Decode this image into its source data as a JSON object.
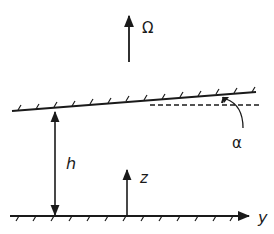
{
  "diagram": {
    "type": "rotating-channel-geometry",
    "labels": {
      "omega": "Ω",
      "height": "h",
      "z_axis": "z",
      "y_axis": "y",
      "angle": "α"
    },
    "elements": [
      {
        "id": "rotation-vector",
        "label": "Ω",
        "direction": "up"
      },
      {
        "id": "top-wall",
        "description": "inclined upper boundary, hatched"
      },
      {
        "id": "reference-line",
        "description": "horizontal dashed line"
      },
      {
        "id": "angle-alpha",
        "label": "α",
        "description": "angle between top wall and horizontal"
      },
      {
        "id": "height-arrow",
        "label": "h",
        "description": "double-headed vertical arrow between walls"
      },
      {
        "id": "z-axis",
        "label": "z",
        "direction": "up"
      },
      {
        "id": "bottom-wall",
        "label": "y",
        "description": "horizontal hatched lower boundary, y-axis"
      }
    ],
    "colors": {
      "ink": "#1a1a1a",
      "background": "#ffffff"
    }
  }
}
